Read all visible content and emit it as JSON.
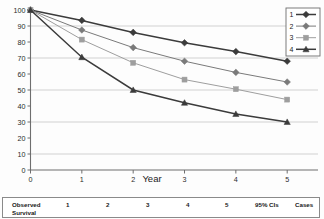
{
  "chart_data": {
    "type": "line",
    "title": "",
    "subtitle": "",
    "xlabel": "Year",
    "ylabel": "",
    "x": [
      0,
      1,
      2,
      3,
      4,
      5
    ],
    "xticks": [
      "0",
      "1",
      "2",
      "3",
      "4",
      "5"
    ],
    "yticks": [
      "0",
      "10",
      "20",
      "30",
      "40",
      "50",
      "60",
      "70",
      "80",
      "90",
      "100"
    ],
    "xlim": [
      0,
      5.6
    ],
    "ylim": [
      0,
      100
    ],
    "grid": "horizontal-major",
    "legend_position": "top-right",
    "series": [
      {
        "name": "1",
        "marker": "diamond",
        "color": "#3b3b3b",
        "values": [
          100,
          93.5,
          86,
          79.5,
          74,
          68
        ]
      },
      {
        "name": "2",
        "marker": "diamond",
        "color": "#7a7a7a",
        "values": [
          100,
          87.5,
          76.5,
          68,
          61,
          55
        ]
      },
      {
        "name": "3",
        "marker": "square",
        "color": "#9e9e9e",
        "values": [
          100,
          81.5,
          67,
          56.5,
          50.5,
          44
        ]
      },
      {
        "name": "4",
        "marker": "triangle",
        "color": "#3b3b3b",
        "values": [
          100,
          70.5,
          50,
          42,
          35,
          30
        ]
      }
    ],
    "legend": [
      {
        "label": "1"
      },
      {
        "label": "2"
      },
      {
        "label": "3"
      },
      {
        "label": "4"
      }
    ]
  },
  "table": {
    "row_header": "Observed",
    "row_header_line2": "Survival",
    "columns": [
      "1",
      "2",
      "3",
      "4",
      "5",
      "95% CIs",
      "Cases"
    ]
  },
  "colors": {
    "axis": "#6e6e6e",
    "grid": "#bdbdbd",
    "text": "#1a1a1a",
    "series1": "#3b3b3b",
    "series2": "#7a7a7a",
    "series3": "#9e9e9e",
    "series4": "#3b3b3b"
  }
}
